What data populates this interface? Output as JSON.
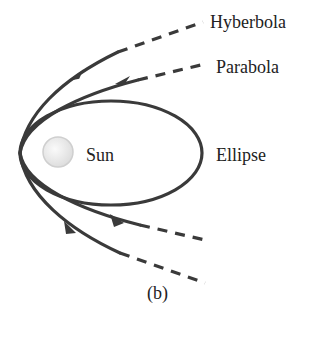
{
  "diagram": {
    "labels": {
      "hyperbola": "Hyberbola",
      "parabola": "Parabola",
      "ellipse": "Ellipse",
      "sun": "Sun",
      "caption": "(b)"
    },
    "colors": {
      "orbit": "#3a3a3a",
      "sun_fill": "#eeeeee",
      "sun_stroke": "#cccccc",
      "text": "#222222"
    }
  }
}
